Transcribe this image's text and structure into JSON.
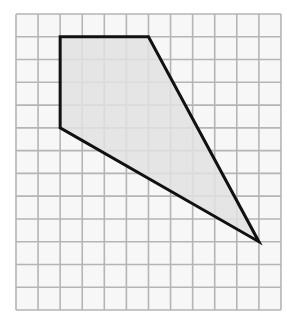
{
  "diagram": {
    "grid": {
      "columns": 12,
      "rows": 13,
      "origin_px": [
        16,
        14
      ],
      "cell_w_px": 22.08,
      "cell_h_px": 22.77,
      "line_color": "#b5b5b5",
      "background_color": "#f7f7f7"
    },
    "shape": {
      "type": "quadrilateral",
      "vertices_grid": [
        [
          2,
          1
        ],
        [
          6,
          1
        ],
        [
          11,
          10
        ],
        [
          2,
          5
        ]
      ],
      "fill_color": "#e2e2e2",
      "stroke_color": "#111111",
      "stroke_width": 3
    }
  }
}
